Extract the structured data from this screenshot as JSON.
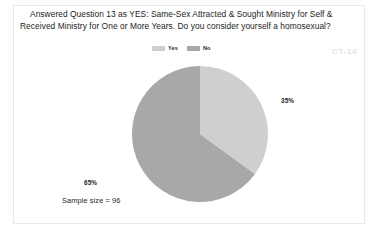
{
  "slide": {
    "title_line_1": "Answered Question 13 as YES: Same-Sex Attracted & Sought Ministry for Self &",
    "title_line_2": "Received Ministry for One or More Years. Do you consider yourself a homosexual?",
    "watermark": "CT-14",
    "sample_size_label": "Sample size = 96"
  },
  "legend": {
    "position": "top-center",
    "entries": [
      {
        "label": "Yes",
        "color": "#cfcfcf"
      },
      {
        "label": "No",
        "color": "#a8a8a8"
      }
    ]
  },
  "labels": {
    "yes_pct": "35%",
    "no_pct": "65%"
  },
  "chart_data": {
    "type": "pie",
    "title": "Answered Question 13 as YES: Same-Sex Attracted & Sought Ministry for Self & Received Ministry for One or More Years. Do you consider yourself a homosexual?",
    "categories": [
      "Yes",
      "No"
    ],
    "values": [
      35,
      65
    ],
    "value_labels": [
      "35%",
      "65%"
    ],
    "units": "percent",
    "colors": [
      "#cfcfcf",
      "#a8a8a8"
    ],
    "sample_size": 96,
    "sample_size_label": "Sample size = 96",
    "legend": "top-center",
    "start_angle_deg": 0,
    "direction": "clockwise",
    "annotations": [
      "CT-14"
    ]
  }
}
